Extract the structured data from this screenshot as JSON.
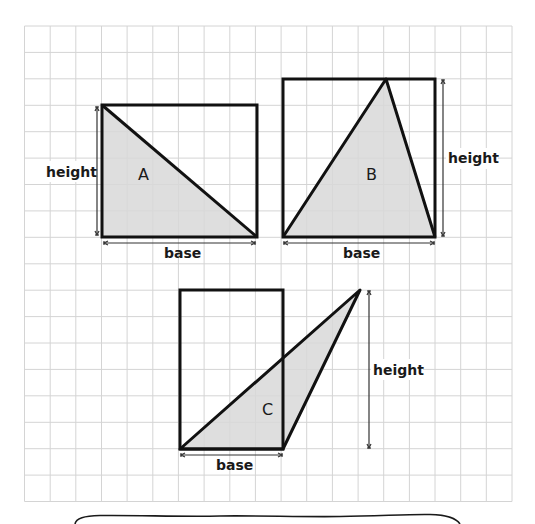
{
  "diagram": {
    "type": "area-of-triangles-on-grid",
    "colors": {
      "grid": "#d4d4d4",
      "outline": "#111111",
      "fill": "#d8d8d8",
      "arrow": "#333333"
    },
    "grid": {
      "columns": 19,
      "rows": 18
    },
    "shapes": [
      {
        "id": "A",
        "label": "A",
        "base_label": "base",
        "height_label": "height",
        "rectangle_cells": {
          "width": 6,
          "height": 5
        },
        "triangle": "right triangle: top-left, bottom-left, bottom-right"
      },
      {
        "id": "B",
        "label": "B",
        "base_label": "base",
        "height_label": "height",
        "rectangle_cells": {
          "width": 6,
          "height": 6
        },
        "triangle": "apex on top edge at 4 cells from left"
      },
      {
        "id": "C",
        "label": "C",
        "base_label": "base",
        "height_label": "height",
        "rectangle_cells": {
          "width": 4,
          "height": 6
        },
        "triangle": "obtuse triangle, apex 3 cells right of rectangle"
      }
    ],
    "answer_box": {
      "text": ""
    }
  }
}
